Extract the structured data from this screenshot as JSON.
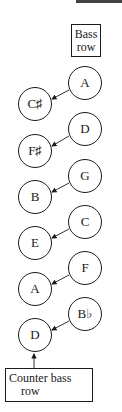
{
  "diagram": {
    "labels": {
      "bass_row": [
        "Bass",
        "row"
      ],
      "counter_bass_row": [
        "Counter bass",
        "row"
      ]
    },
    "bass_row_notes": [
      "A",
      "D",
      "G",
      "C",
      "F",
      "B♭"
    ],
    "counter_bass_row_notes": [
      "C♯",
      "F♯",
      "B",
      "E",
      "A",
      "D"
    ],
    "relationships": [
      {
        "from": "A",
        "to": "C♯"
      },
      {
        "from": "D",
        "to": "F♯"
      },
      {
        "from": "G",
        "to": "B"
      },
      {
        "from": "C",
        "to": "E"
      },
      {
        "from": "F",
        "to": "A"
      },
      {
        "from": "B♭",
        "to": "D"
      }
    ],
    "colors": {
      "stroke": "#1a1a1a",
      "background": "#ffffff"
    }
  }
}
